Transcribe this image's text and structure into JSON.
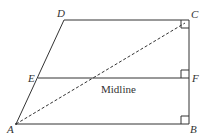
{
  "diagram": {
    "points": {
      "A": {
        "label": "A",
        "x": 16,
        "y": 124
      },
      "B": {
        "label": "B",
        "x": 189,
        "y": 124
      },
      "C": {
        "label": "C",
        "x": 189,
        "y": 20
      },
      "D": {
        "label": "D",
        "x": 64,
        "y": 20
      },
      "E": {
        "label": "E",
        "x": 38,
        "y": 78
      },
      "F": {
        "label": "F",
        "x": 189,
        "y": 78
      }
    },
    "midline_label": "Midline",
    "colors": {
      "stroke": "#333333",
      "background": "#ffffff"
    }
  }
}
